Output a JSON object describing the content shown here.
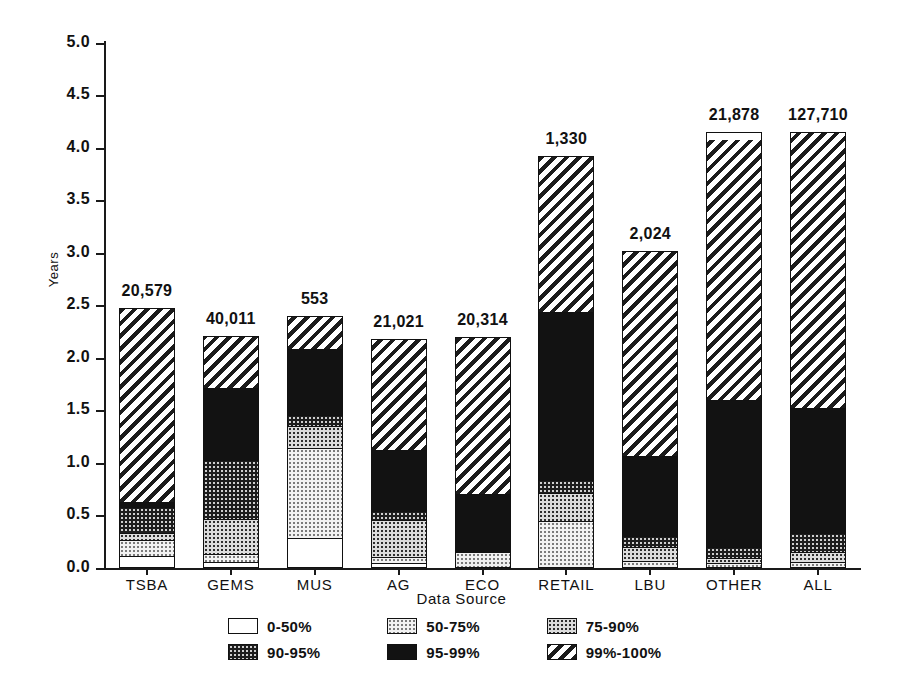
{
  "chart_data": {
    "type": "bar",
    "title": "",
    "subtitle": "",
    "xlabel": "Data Source",
    "ylabel": "Years",
    "ylim": [
      0.0,
      5.0
    ],
    "ytick_labels": [
      "0.0",
      "0.5",
      "1.0",
      "1.5",
      "2.0",
      "2.5",
      "3.0",
      "3.5",
      "4.0",
      "4.5",
      "5.0"
    ],
    "ytick_values": [
      0.0,
      0.5,
      1.0,
      1.5,
      2.0,
      2.5,
      3.0,
      3.5,
      4.0,
      4.5,
      5.0
    ],
    "grid": false,
    "stacked": true,
    "legend_position": "bottom",
    "categories": [
      "TSBA",
      "GEMS",
      "MUS",
      "AG",
      "ECO",
      "RETAIL",
      "LBU",
      "OTHER",
      "ALL"
    ],
    "bar_labels": [
      "20,579",
      "40,011",
      "553",
      "21,021",
      "20,314",
      "1,330",
      "2,024",
      "21,878",
      "127,710"
    ],
    "totals": [
      2.48,
      2.21,
      2.4,
      2.18,
      2.2,
      3.92,
      3.02,
      4.15,
      4.15
    ],
    "series": [
      {
        "name": "0-50%",
        "pattern": "white",
        "values": [
          0.1,
          0.04,
          0.27,
          0.03,
          0.0,
          0.0,
          0.0,
          0.0,
          0.0
        ]
      },
      {
        "name": "50-75%",
        "pattern": "lightdot",
        "values": [
          0.15,
          0.08,
          0.86,
          0.06,
          0.13,
          0.43,
          0.05,
          0.03,
          0.04
        ]
      },
      {
        "name": "75-90%",
        "pattern": "meddot",
        "values": [
          0.07,
          0.33,
          0.21,
          0.35,
          0.0,
          0.27,
          0.13,
          0.05,
          0.09
        ]
      },
      {
        "name": "90-95%",
        "pattern": "darkdot",
        "values": [
          0.25,
          0.57,
          0.11,
          0.09,
          0.0,
          0.12,
          0.11,
          0.1,
          0.19
        ]
      },
      {
        "name": "95-99%",
        "pattern": "solid",
        "values": [
          0.04,
          0.69,
          0.63,
          0.58,
          0.56,
          1.61,
          0.76,
          1.4,
          1.19
        ]
      },
      {
        "name": "99%-100%",
        "pattern": "hatch",
        "values": [
          1.87,
          0.5,
          0.32,
          1.07,
          1.51,
          1.49,
          1.97,
          2.49,
          2.64
        ]
      }
    ],
    "legend": [
      {
        "label": "0-50%",
        "pattern": "white"
      },
      {
        "label": "50-75%",
        "pattern": "lightdot"
      },
      {
        "label": "75-90%",
        "pattern": "meddot"
      },
      {
        "label": "90-95%",
        "pattern": "darkdot"
      },
      {
        "label": "95-99%",
        "pattern": "solid"
      },
      {
        "label": "99%-100%",
        "pattern": "hatch"
      }
    ]
  },
  "colors": {
    "axis": "#111111",
    "ink": "#111111",
    "background": "#ffffff"
  }
}
